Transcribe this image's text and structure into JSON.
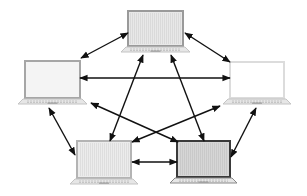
{
  "diagram": {
    "type": "full-mesh-network",
    "nodes": [
      {
        "id": "top",
        "x": 128,
        "y": 11,
        "w": 55,
        "h": 35,
        "bezel": "#9a9a9a",
        "screen": "#e8e8e8",
        "stripes": true
      },
      {
        "id": "left",
        "x": 25,
        "y": 61,
        "w": 55,
        "h": 37,
        "bezel": "#a6a6a6",
        "screen": "#f4f4f4",
        "stripes": false
      },
      {
        "id": "right",
        "x": 230,
        "y": 62,
        "w": 54,
        "h": 36,
        "bezel": "#dcdcdc",
        "screen": "#ffffff",
        "stripes": false
      },
      {
        "id": "bottom-left",
        "x": 77,
        "y": 141,
        "w": 54,
        "h": 37,
        "bezel": "#b4b4b4",
        "screen": "#ececec",
        "stripes": true
      },
      {
        "id": "bottom-right",
        "x": 177,
        "y": 141,
        "w": 53,
        "h": 36,
        "bezel": "#3a3a3a",
        "screen": "#d6d6d6",
        "stripes": true
      }
    ],
    "edges": [
      {
        "from": "top",
        "to": "left",
        "x1": 128,
        "y1": 33,
        "x2": 81,
        "y2": 58
      },
      {
        "from": "top",
        "to": "right",
        "x1": 185,
        "y1": 33,
        "x2": 230,
        "y2": 62
      },
      {
        "from": "left",
        "to": "right",
        "x1": 80,
        "y1": 78,
        "x2": 230,
        "y2": 78
      },
      {
        "from": "top",
        "to": "bottom-left",
        "x1": 143,
        "y1": 55,
        "x2": 110,
        "y2": 141
      },
      {
        "from": "top",
        "to": "bottom-right",
        "x1": 171,
        "y1": 55,
        "x2": 204,
        "y2": 141
      },
      {
        "from": "left",
        "to": "bottom-right",
        "x1": 91,
        "y1": 103,
        "x2": 178,
        "y2": 142
      },
      {
        "from": "right",
        "to": "bottom-left",
        "x1": 220,
        "y1": 106,
        "x2": 132,
        "y2": 142
      },
      {
        "from": "left",
        "to": "bottom-left",
        "x1": 49,
        "y1": 108,
        "x2": 75,
        "y2": 155
      },
      {
        "from": "right",
        "to": "bottom-right",
        "x1": 256,
        "y1": 108,
        "x2": 231,
        "y2": 157
      },
      {
        "from": "bottom-left",
        "to": "bottom-right",
        "x1": 132,
        "y1": 162,
        "x2": 177,
        "y2": 162
      }
    ],
    "arrow_color": "#111111"
  }
}
